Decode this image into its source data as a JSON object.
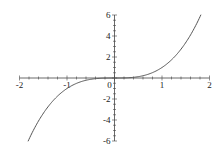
{
  "chart_data": {
    "type": "line",
    "title": "",
    "xlabel": "",
    "ylabel": "",
    "function": "x^3",
    "xlim": [
      -2,
      2
    ],
    "ylim": [
      -6,
      6
    ],
    "grid": false,
    "legend": null,
    "x_ticks": [
      -2,
      -1,
      0,
      1,
      2
    ],
    "y_ticks": [
      -6,
      -4,
      -2,
      2,
      4,
      6
    ],
    "x_tick_labels": [
      "-2",
      "-1",
      "0",
      "1",
      "2"
    ],
    "y_tick_labels": [
      "-6",
      "-4",
      "-2",
      "2",
      "4",
      "6"
    ],
    "series": [
      {
        "name": "x^3",
        "color": "#555555",
        "x": [
          -1.82,
          -1.6,
          -1.4,
          -1.2,
          -1.0,
          -0.8,
          -0.6,
          -0.4,
          -0.2,
          0.0,
          0.2,
          0.4,
          0.6,
          0.8,
          1.0,
          1.2,
          1.4,
          1.6,
          1.82
        ],
        "y": [
          -6.03,
          -4.1,
          -2.74,
          -1.73,
          -1.0,
          -0.51,
          -0.22,
          -0.06,
          -0.01,
          0.0,
          0.01,
          0.06,
          0.22,
          0.51,
          1.0,
          1.73,
          2.74,
          4.1,
          6.03
        ]
      }
    ]
  },
  "colors": {
    "axis": "#444444",
    "curve": "#555555",
    "background": "#ffffff"
  }
}
